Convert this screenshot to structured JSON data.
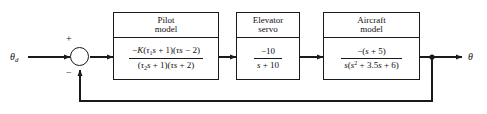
{
  "diagram": {
    "input_label": "θd",
    "output_label": "θ",
    "summing_junction": {
      "plus_sign": "+",
      "minus_sign": "−"
    },
    "blocks": [
      {
        "name": "pilot",
        "title_line1": "Pilot",
        "title_line2": "model",
        "numerator": "−K(τ1s + 1)(τs − 2)",
        "denominator": "(τ2s + 1)(τs + 2)"
      },
      {
        "name": "elevator-servo",
        "title_line1": "Elevator",
        "title_line2": "servo",
        "numerator": "−10",
        "denominator": "s + 10"
      },
      {
        "name": "aircraft",
        "title_line1": "Aircraft",
        "title_line2": "model",
        "numerator": "−(s + 5)",
        "denominator": "s(s2 + 3.5s + 6)"
      }
    ],
    "colors": {
      "line": "#1a1a1a",
      "text": "#111111",
      "background": "#ffffff"
    }
  }
}
